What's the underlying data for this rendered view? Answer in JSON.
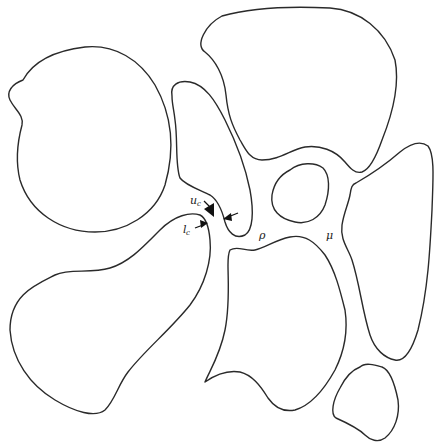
{
  "figure": {
    "type": "grain-boundary-sketch",
    "stroke_color": "#2a2a2a",
    "background": "#ffffff",
    "grains": [
      {
        "id": "grain-top-left",
        "d": "M 23 80 C 35 58 60 50 85 47 C 115 44 140 60 155 85 C 172 115 175 150 165 185 C 155 215 125 232 95 232 C 60 232 30 212 20 180 C 15 160 18 140 22 125 C 24 115 15 110 10 100 C 6 92 12 84 23 80 Z"
      },
      {
        "id": "grain-top-right",
        "d": "M 222 16 C 250 8 290 6 330 8 C 360 10 385 30 395 60 C 400 85 392 115 382 140 C 375 160 368 170 362 172 C 355 174 350 168 345 162 C 335 150 320 145 305 147 C 290 150 280 160 262 160 C 250 160 246 150 240 140 C 232 125 228 115 226 95 C 224 75 215 60 205 52 C 195 45 205 25 222 16 Z"
      },
      {
        "id": "grain-center-tall",
        "d": "M 172 96 C 170 85 178 80 190 82 C 205 85 215 100 225 120 C 235 140 245 165 250 190 C 254 212 253 230 245 235 C 235 240 228 232 225 222 C 222 210 218 200 210 195 C 200 190 185 185 180 178 C 175 165 178 140 175 120 C 174 110 172 104 172 96 Z"
      },
      {
        "id": "grain-small-oval",
        "d": "M 290 170 C 300 162 315 162 323 168 C 330 175 330 190 325 205 C 320 218 308 225 295 222 C 280 219 270 210 272 195 C 274 183 280 175 290 170 Z"
      },
      {
        "id": "grain-right-wedge",
        "d": "M 356 183 C 370 175 385 165 400 152 C 410 144 420 140 428 146 C 435 155 433 180 432 210 C 430 250 428 290 418 330 C 412 350 405 362 395 360 C 385 358 375 350 370 335 C 362 310 360 285 352 260 C 348 248 340 240 342 225 C 344 212 348 205 350 195 C 351 188 352 184 356 183 Z"
      },
      {
        "id": "grain-bottom-left",
        "d": "M 200 215 C 190 212 175 215 160 230 C 145 245 130 262 110 268 C 90 274 70 268 55 275 C 35 285 10 295 10 330 C 12 360 30 385 55 400 C 75 412 95 418 105 410 C 115 400 118 385 128 372 C 145 350 170 330 190 305 C 205 285 212 260 210 240 C 209 228 206 218 200 215 Z"
      },
      {
        "id": "grain-bottom-center",
        "d": "M 230 250 C 238 245 245 252 255 250 C 265 248 275 240 290 237 C 305 234 315 242 325 255 C 335 270 340 290 345 310 C 348 330 345 350 335 370 C 325 388 312 405 295 410 C 285 412 275 408 268 398 C 260 385 252 375 240 372 C 228 370 215 375 205 382 C 210 370 220 355 225 330 C 230 305 228 280 228 265 C 228 258 228 254 230 250 Z"
      },
      {
        "id": "grain-bottom-right-small",
        "d": "M 360 367 C 365 362 375 365 382 367 C 390 370 395 385 398 400 C 400 415 395 430 385 438 C 378 443 370 440 365 435 C 358 428 345 422 336 418 C 330 414 333 400 340 388 C 345 378 352 370 360 367 Z"
      }
    ]
  },
  "labels": {
    "uc": {
      "main": "u",
      "sub": "c"
    },
    "lc": {
      "main": "l",
      "sub": "c"
    },
    "rho": "ρ",
    "mu": "μ"
  },
  "caption": {
    "text_visible": ""
  }
}
